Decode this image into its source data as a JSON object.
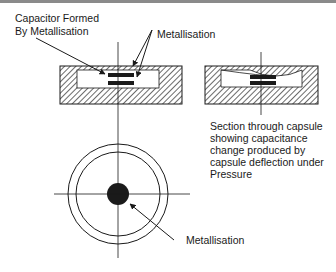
{
  "diagram": {
    "labels": {
      "capacitor_line1": "Capacitor Formed",
      "capacitor_line2": "By Metallisation",
      "metallisation_top": "Metallisation",
      "section_caption": [
        "Section through capsule",
        "showing capacitance",
        "change produced by",
        "capsule deflection under",
        "Pressure"
      ],
      "metallisation_bottom": "Metallisation"
    },
    "colors": {
      "ink": "#1a1a1a",
      "border": "#8a8a8a",
      "background": "#ffffff"
    }
  }
}
